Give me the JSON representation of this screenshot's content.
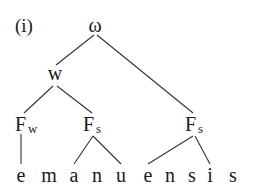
{
  "example_label": "(i)",
  "tree": {
    "root": {
      "label": "ω"
    },
    "weak_node": {
      "label": "w"
    },
    "feet": [
      {
        "label": "F",
        "subscript": "w"
      },
      {
        "label": "F",
        "subscript": "s"
      },
      {
        "label": "F",
        "subscript": "s"
      }
    ]
  },
  "segments": [
    "e",
    "m",
    "a",
    "n",
    "u",
    "e",
    "n",
    "s",
    "i",
    "s"
  ],
  "word": "emanuensis",
  "colors": {
    "text": "#1a1a1a",
    "lines": "#333333",
    "background": "#ffffff"
  }
}
